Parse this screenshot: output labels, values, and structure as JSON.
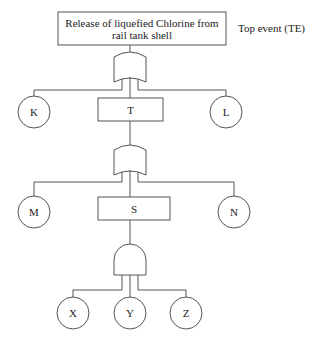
{
  "top_event": {
    "label_line1": "Release of liquefied Chlorine from",
    "label_line2": "rail tank shell",
    "annotation": "Top event (TE)"
  },
  "gates": [
    {
      "id": "G1",
      "type": "OR",
      "inputs": [
        "K",
        "T",
        "L"
      ],
      "output": "TE"
    },
    {
      "id": "G2",
      "type": "OR",
      "inputs": [
        "M",
        "S",
        "N"
      ],
      "output": "T"
    },
    {
      "id": "G3",
      "type": "AND",
      "inputs": [
        "X",
        "Y",
        "Z"
      ],
      "output": "S"
    }
  ],
  "intermediate_events": {
    "T": "T",
    "S": "S"
  },
  "basic_events": {
    "K": "K",
    "L": "L",
    "M": "M",
    "N": "N",
    "X": "X",
    "Y": "Y",
    "Z": "Z"
  },
  "colors": {
    "line": "#555555",
    "text": "#222222",
    "background": "#ffffff"
  }
}
